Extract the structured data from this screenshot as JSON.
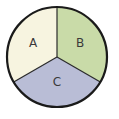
{
  "diagram": {
    "type": "pie-sectors",
    "center": [
      57,
      57
    ],
    "radius": 50,
    "outline_color": "#1a1a1a",
    "sectors": [
      {
        "label": "A",
        "color": "#f7f4e0",
        "start_deg": -90,
        "end_deg": -210
      },
      {
        "label": "B",
        "color": "#c9dba8",
        "start_deg": -90,
        "end_deg": 30
      },
      {
        "label": "C",
        "color": "#b9bdd6",
        "start_deg": 30,
        "end_deg": 150
      }
    ]
  }
}
